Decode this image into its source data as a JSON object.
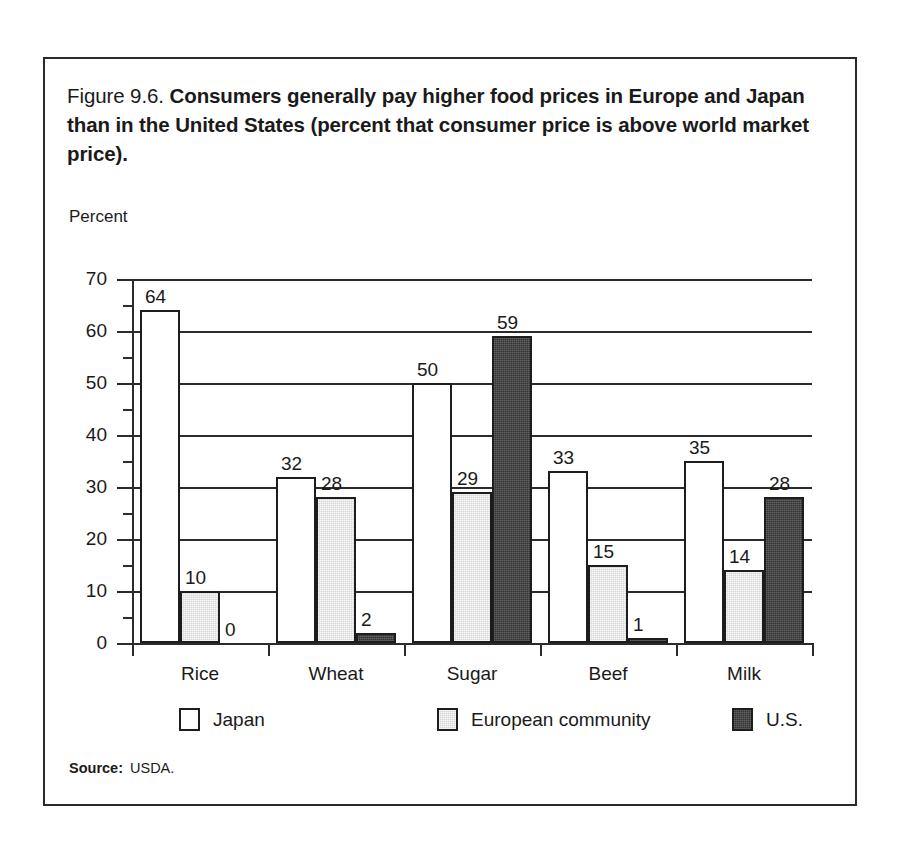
{
  "figure": {
    "number": "Figure 9.6.",
    "title": "Consumers generally pay higher food prices in Europe and Japan than in the United States (percent that consumer price is above world market price).",
    "axis_unit_label": "Percent",
    "source_label": "Source:",
    "source_value": "USDA."
  },
  "chart_data": {
    "type": "bar",
    "title": "Consumers generally pay higher food prices in Europe and Japan than in the United States (percent that consumer price is above world market price).",
    "xlabel": "",
    "ylabel": "Percent",
    "ylim": [
      0,
      70
    ],
    "ytick_values": [
      0,
      10,
      20,
      30,
      40,
      50,
      60,
      70
    ],
    "ytick_labels": [
      "0",
      "10",
      "20",
      "30",
      "40",
      "50",
      "60",
      "70"
    ],
    "minor_tick_step": 5,
    "grid": "horizontal",
    "legend_position": "bottom",
    "categories": [
      "Rice",
      "Wheat",
      "Sugar",
      "Beef",
      "Milk"
    ],
    "series": [
      {
        "name": "Japan",
        "fill": "white",
        "color": "#ffffff",
        "values": [
          64,
          32,
          50,
          33,
          35
        ],
        "labels": [
          "64",
          "32",
          "50",
          "33",
          "35"
        ]
      },
      {
        "name": "European community",
        "fill": "light-gray-stipple",
        "color": "#d7d7d7",
        "values": [
          10,
          28,
          29,
          15,
          14
        ],
        "labels": [
          "10",
          "28",
          "29",
          "15",
          "14"
        ]
      },
      {
        "name": "U.S.",
        "fill": "dark-gray-stipple",
        "color": "#343434",
        "values": [
          0,
          2,
          59,
          1,
          28
        ],
        "labels": [
          "0",
          "2",
          "59",
          "1",
          "28"
        ]
      }
    ]
  }
}
